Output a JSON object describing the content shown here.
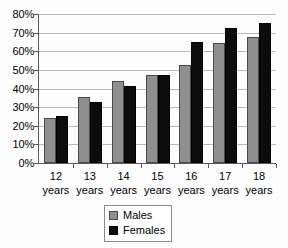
{
  "chart_data": {
    "type": "bar",
    "title": "",
    "subtitle": "",
    "xlabel": "",
    "ylabel": "",
    "ylim": [
      0,
      80
    ],
    "ytick_labels": [
      "0%",
      "10%",
      "20%",
      "30%",
      "40%",
      "50%",
      "60%",
      "70%",
      "80%"
    ],
    "ytick_values": [
      0,
      10,
      20,
      30,
      40,
      50,
      60,
      70,
      80
    ],
    "grid": true,
    "legend_position": "bottom",
    "categories": [
      "12 years",
      "13 years",
      "14 years",
      "15 years",
      "16 years",
      "17 years",
      "18 years"
    ],
    "category_lines": [
      {
        "num": "12",
        "unit": "years"
      },
      {
        "num": "13",
        "unit": "years"
      },
      {
        "num": "14",
        "unit": "years"
      },
      {
        "num": "15",
        "unit": "years"
      },
      {
        "num": "16",
        "unit": "years"
      },
      {
        "num": "17",
        "unit": "years"
      },
      {
        "num": "18",
        "unit": "years"
      }
    ],
    "series": [
      {
        "name": "Males",
        "color": "#8f8f8f",
        "values": [
          24,
          35.5,
          44,
          47.5,
          52.5,
          64.5,
          67.5
        ]
      },
      {
        "name": "Females",
        "color": "#0c0c0c",
        "values": [
          25.5,
          32.5,
          41.5,
          47.5,
          65,
          72.5,
          75
        ]
      }
    ]
  },
  "legend": {
    "items": [
      {
        "label": "Males",
        "color": "#8f8f8f"
      },
      {
        "label": "Females",
        "color": "#0c0c0c"
      }
    ]
  },
  "colors": {
    "males": "#8f8f8f",
    "females": "#0c0c0c",
    "axis": "#5a5a5a",
    "gridline": "#b9b9b9",
    "background": "#fdfdfd"
  }
}
